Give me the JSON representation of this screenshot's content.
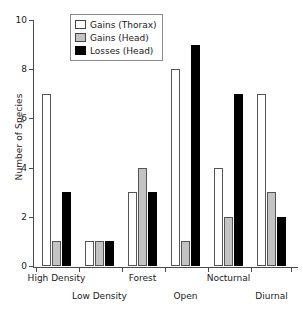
{
  "chart_data": {
    "type": "bar",
    "title": "",
    "xlabel": "",
    "ylabel": "Number of Species",
    "ylim": [
      0,
      10
    ],
    "yticks": [
      0,
      2,
      4,
      6,
      8,
      10
    ],
    "ytick_labels": [
      "0",
      "2",
      "4",
      "6",
      "8",
      "10"
    ],
    "grid": false,
    "legend_position": "top-left-inside",
    "categories": [
      "High Density",
      "Low Density",
      "Forest",
      "Open",
      "Nocturnal",
      "Diurnal"
    ],
    "series": [
      {
        "name": "Gains (Thorax)",
        "color": "#ffffff",
        "values": [
          7,
          1,
          3,
          8,
          4,
          7
        ]
      },
      {
        "name": "Gains (Head)",
        "color": "#c3c3c3",
        "values": [
          1,
          1,
          4,
          1,
          2,
          3
        ]
      },
      {
        "name": "Losses (Head)",
        "color": "#000000",
        "values": [
          3,
          1,
          3,
          9,
          7,
          2
        ]
      }
    ]
  },
  "legend": {
    "items": [
      {
        "label": "Gains (Thorax)",
        "swatch": "thorax"
      },
      {
        "label": "Gains (Head)",
        "swatch": "head-gain"
      },
      {
        "label": "Losses (Head)",
        "swatch": "head-loss"
      }
    ]
  },
  "axes": {
    "y_title": "Number of Species"
  }
}
